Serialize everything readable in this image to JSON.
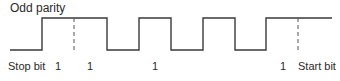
{
  "title": "Odd parity",
  "colors": {
    "line": "#3a3a3a",
    "dashed": "#555555",
    "text": "#2a2a2a"
  },
  "waveform": {
    "high_y": 18,
    "low_y": 50,
    "points": "10,50 42,50 42,18 107,18 107,50 139,50 139,18 171,18 171,50 203,50 203,18 235,18 235,50 266,50 266,18 332,18",
    "dashed_markers": [
      {
        "x": 74,
        "y1": 18,
        "y2": 50
      },
      {
        "x": 298,
        "y1": 18,
        "y2": 52
      }
    ]
  },
  "labels": [
    {
      "text": "Stop bit",
      "x": 8
    },
    {
      "text": "1",
      "x": 55
    },
    {
      "text": "1",
      "x": 87
    },
    {
      "text": "1",
      "x": 152
    },
    {
      "text": "1",
      "x": 280
    },
    {
      "text": "Start bit",
      "x": 298
    }
  ]
}
